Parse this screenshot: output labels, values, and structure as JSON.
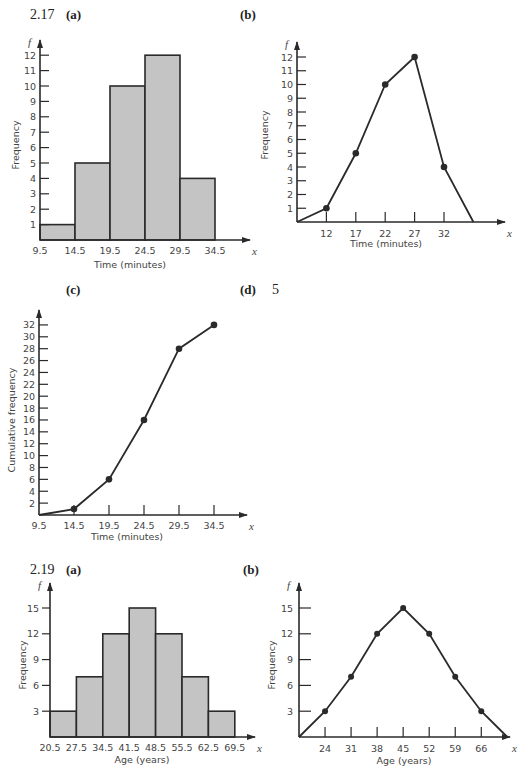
{
  "labels": {
    "ex217": "2.17",
    "ex219": "2.19",
    "a": "(a)",
    "b": "(b)",
    "c": "(c)",
    "d": "(d)",
    "d_value": "5",
    "f": "f",
    "x": "x"
  },
  "chart_data": [
    {
      "id": "2.17a",
      "type": "bar",
      "title": "(a)",
      "xlabel": "Time (minutes)",
      "ylabel": "Frequency",
      "x_tick_labels": [
        "9.5",
        "14.5",
        "19.5",
        "24.5",
        "29.5",
        "34.5"
      ],
      "y_tick_labels": [
        "1",
        "2",
        "3",
        "4",
        "5",
        "6",
        "7",
        "8",
        "9",
        "10",
        "11",
        "12"
      ],
      "categories": [
        "9.5-14.5",
        "14.5-19.5",
        "19.5-24.5",
        "24.5-29.5",
        "29.5-34.5"
      ],
      "values": [
        1,
        5,
        10,
        12,
        4
      ],
      "ylim": [
        0,
        12
      ],
      "grid": false
    },
    {
      "id": "2.17b",
      "type": "line",
      "title": "(b)",
      "xlabel": "Time (minutes)",
      "ylabel": "Frequency",
      "x_tick_labels": [
        "12",
        "17",
        "22",
        "27",
        "32"
      ],
      "y_tick_labels": [
        "1",
        "2",
        "3",
        "4",
        "5",
        "6",
        "7",
        "8",
        "9",
        "10",
        "11",
        "12"
      ],
      "x": [
        7,
        12,
        17,
        22,
        27,
        32,
        37
      ],
      "values": [
        0,
        1,
        5,
        10,
        12,
        4,
        0
      ],
      "ylim": [
        0,
        12
      ],
      "grid": false
    },
    {
      "id": "2.17c",
      "type": "line",
      "title": "(c)",
      "xlabel": "Time (minutes)",
      "ylabel": "Cumulative frequency",
      "x_tick_labels": [
        "9.5",
        "14.5",
        "19.5",
        "24.5",
        "29.5",
        "34.5"
      ],
      "y_tick_labels": [
        "2",
        "4",
        "6",
        "8",
        "10",
        "12",
        "14",
        "16",
        "18",
        "20",
        "22",
        "24",
        "26",
        "28",
        "30",
        "32"
      ],
      "x": [
        9.5,
        14.5,
        19.5,
        24.5,
        29.5,
        34.5
      ],
      "values": [
        0,
        1,
        6,
        16,
        28,
        32
      ],
      "ylim": [
        0,
        32
      ],
      "grid": false
    },
    {
      "id": "2.19a",
      "type": "bar",
      "title": "(a)",
      "xlabel": "Age (years)",
      "ylabel": "Frequency",
      "x_tick_labels": [
        "20.5",
        "27.5",
        "34.5",
        "41.5",
        "48.5",
        "55.5",
        "62.5",
        "69.5"
      ],
      "y_tick_labels": [
        "3",
        "6",
        "9",
        "12",
        "15"
      ],
      "categories": [
        "20.5-27.5",
        "27.5-34.5",
        "34.5-41.5",
        "41.5-48.5",
        "48.5-55.5",
        "55.5-62.5",
        "62.5-69.5"
      ],
      "values": [
        3,
        7,
        12,
        15,
        12,
        7,
        3
      ],
      "ylim": [
        0,
        15
      ],
      "grid": false
    },
    {
      "id": "2.19b",
      "type": "line",
      "title": "(b)",
      "xlabel": "Age (years)",
      "ylabel": "Frequency",
      "x_tick_labels": [
        "24",
        "31",
        "38",
        "45",
        "52",
        "59",
        "66"
      ],
      "y_tick_labels": [
        "3",
        "6",
        "9",
        "12",
        "15"
      ],
      "x": [
        17,
        24,
        31,
        38,
        45,
        52,
        59,
        66,
        73
      ],
      "values": [
        0,
        3,
        7,
        12,
        15,
        12,
        7,
        3,
        0
      ],
      "ylim": [
        0,
        15
      ],
      "grid": false
    }
  ]
}
